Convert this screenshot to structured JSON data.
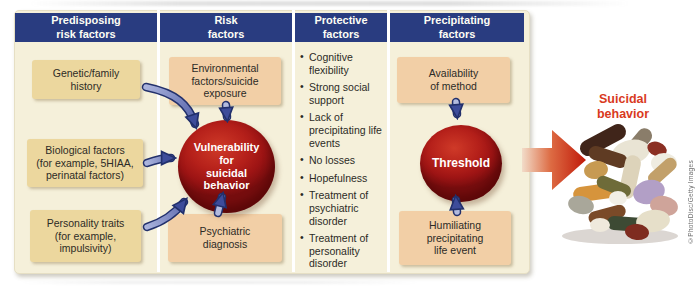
{
  "colors": {
    "header_bg": "#293c80",
    "panel_bg": "#f5f0da",
    "predisposing_box": "#ecd79e",
    "risk_box": "#f2cfa6",
    "node_red": "#b5201a",
    "arrow_blue": "#4a57a3",
    "big_arrow_red": "#c01909",
    "outcome_label_color": "#d93a1e"
  },
  "headers": [
    "Predisposing\nrisk factors",
    "Risk\nfactors",
    "Protective\nfactors",
    "Precipitating\nfactors"
  ],
  "predisposing": {
    "boxes": [
      "Genetic/family\nhistory",
      "Biological factors\n(for example, 5HIAA,\nperinatal factors)",
      "Personality traits\n(for example,\nimpulsivity)"
    ]
  },
  "risk": {
    "top_box": "Environmental\nfactors/suicide\nexposure",
    "node": "Vulnerability\nfor\nsuicidal\nbehavior",
    "bottom_box": "Psychiatric\ndiagnosis"
  },
  "protective": {
    "bullets": [
      "Cognitive flexibility",
      "Strong social support",
      "Lack of precipitating life events",
      "No losses",
      "Hopefulness",
      "Treatment of psychiatric disorder",
      "Treatment of personality disorder"
    ]
  },
  "precipitating": {
    "top_box": "Availability\nof method",
    "node": "Threshold",
    "bottom_box": "Humiliating\nprecipitating\nlife event"
  },
  "outcome": {
    "label": "Suicidal\nbehavior",
    "image": "pile-of-pills"
  },
  "credit": "©PhotoDisc/Getty Images"
}
